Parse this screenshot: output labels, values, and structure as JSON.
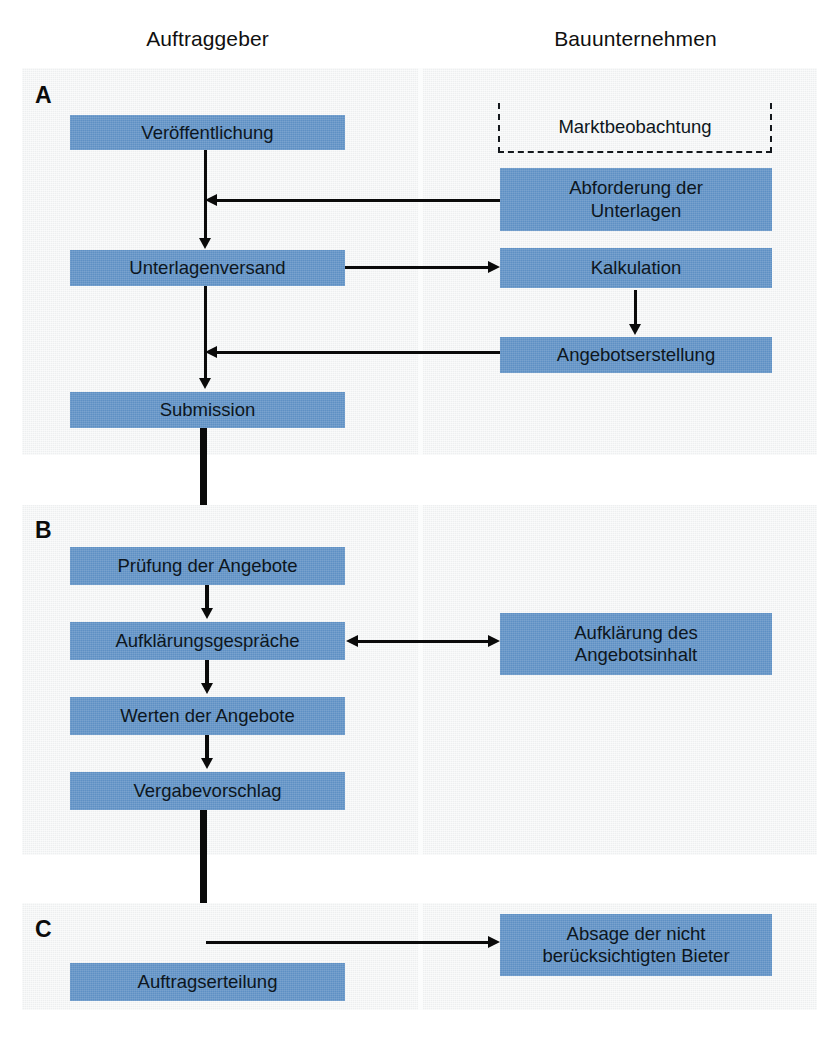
{
  "diagram": {
    "columns": [
      {
        "id": "auftraggeber",
        "label": "Auftraggeber"
      },
      {
        "id": "bauunternehmen",
        "label": "Bauunternehmen"
      }
    ],
    "colors": {
      "box_fill": "#5e90c4",
      "panel_fill": "#edeff0",
      "connector": "#0a0a0a",
      "page_background": "#ffffff",
      "text": "#0d1620"
    },
    "sections": [
      {
        "id": "section-a",
        "label": "A",
        "nodes": {
          "veroeffentlichung": "Veröffentlichung",
          "unterlagenversand": "Unterlagenversand",
          "submission": "Submission",
          "marktbeobachtung": "Marktbeobachtung",
          "abforderung_line1": "Abforderung der",
          "abforderung_line2": "Unterlagen",
          "kalkulation": "Kalkulation",
          "angebotserstellung": "Angebotserstellung"
        }
      },
      {
        "id": "section-b",
        "label": "B",
        "nodes": {
          "pruefung": "Prüfung der Angebote",
          "aufklaerungsgespraeche": "Aufklärungsgespräche",
          "werten": "Werten der Angebote",
          "vergabevorschlag": "Vergabevorschlag",
          "aufklaerung_line1": "Aufklärung des",
          "aufklaerung_line2": "Angebotsinhalt"
        }
      },
      {
        "id": "section-c",
        "label": "C",
        "nodes": {
          "auftragserteilung": "Auftragserteilung",
          "absage_line1": "Absage der nicht",
          "absage_line2": "berücksichtigten Bieter"
        }
      }
    ]
  }
}
